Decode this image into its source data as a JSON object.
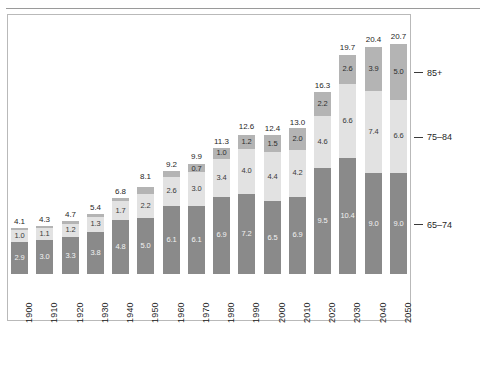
{
  "chart_data": {
    "type": "bar",
    "title": "",
    "subtitle": "",
    "xlabel": "",
    "ylabel": "",
    "stacked": true,
    "grid": false,
    "legend_position": "right",
    "ylim": [
      0,
      22
    ],
    "categories": [
      "1900",
      "1910",
      "1920",
      "1930",
      "1940",
      "1950",
      "1960",
      "1970",
      "1980",
      "1990",
      "2000",
      "2010",
      "2020",
      "2030",
      "2040",
      "2050"
    ],
    "series": [
      {
        "name": "65-74",
        "color": "#8a8a8a",
        "values": [
          2.9,
          3.0,
          3.3,
          3.8,
          4.8,
          5.0,
          6.1,
          6.1,
          6.9,
          7.2,
          6.5,
          6.9,
          9.5,
          10.4,
          9.0,
          9.0
        ],
        "labels": [
          "2.9",
          "3.0",
          "3.3",
          "3.8",
          "4.8",
          "5.0",
          "6.1",
          "6.1",
          "6.9",
          "7.2",
          "6.5",
          "6.9",
          "9.5",
          "10.4",
          "9.0",
          "9.0"
        ]
      },
      {
        "name": "75-84",
        "color": "#e2e2e2",
        "values": [
          1.0,
          1.1,
          1.2,
          1.3,
          1.7,
          2.2,
          2.6,
          3.0,
          3.4,
          4.0,
          4.4,
          4.2,
          4.6,
          6.6,
          7.4,
          6.6
        ],
        "labels": [
          "1.0",
          "1.1",
          "1.2",
          "1.3",
          "1.7",
          "2.2",
          "2.6",
          "3.0",
          "3.4",
          "4.0",
          "4.4",
          "4.2",
          "4.6",
          "6.6",
          "7.4",
          "6.6"
        ]
      },
      {
        "name": "85+",
        "color": "#b4b4b4",
        "values": [
          0.2,
          0.2,
          0.2,
          0.3,
          0.3,
          0.6,
          0.5,
          0.7,
          1.0,
          1.2,
          1.5,
          2.0,
          2.2,
          2.6,
          3.9,
          5.0
        ],
        "labels": [
          "",
          "",
          "",
          "",
          "",
          "",
          "",
          "0.7",
          "1.0",
          "1.2",
          "1.5",
          "2.0",
          "2.2",
          "2.6",
          "3.9",
          "5.0"
        ]
      }
    ],
    "totals": [
      4.1,
      4.3,
      4.7,
      5.4,
      6.8,
      8.1,
      9.2,
      9.9,
      11.3,
      12.6,
      12.4,
      13.0,
      16.3,
      19.7,
      20.4,
      20.7
    ],
    "total_labels": [
      "4.1",
      "4.3",
      "4.7",
      "5.4",
      "6.8",
      "8.1",
      "9.2",
      "9.9",
      "11.3",
      "12.6",
      "12.4",
      "13.0",
      "16.3",
      "19.7",
      "20.4",
      "20.7"
    ],
    "legend_entries": [
      "85+",
      "75-84",
      "65-74"
    ]
  },
  "colors": {
    "series_low": "#8a8a8a",
    "series_mid": "#e2e2e2",
    "series_high": "#b4b4b4",
    "frame": "#b9b9b9",
    "rule": "#9a9a9a",
    "text": "#1f1f1f"
  }
}
